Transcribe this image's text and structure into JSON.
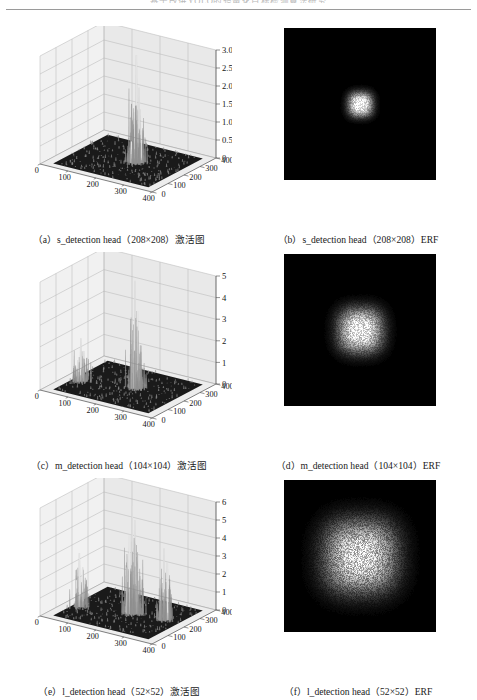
{
  "page": {
    "running_head": "基于改进YOLO的轻量化目标检测算法研究",
    "background_color": "#ffffff"
  },
  "figure": {
    "panels": [
      {
        "id": "a",
        "label": "（a）s_detection head（208×208）激活图",
        "type": "surface3d",
        "head": "s_detection head",
        "resolution": "208×208",
        "kind": "激活图"
      },
      {
        "id": "b",
        "label": "（b）s_detection head（208×208）ERF",
        "type": "erf",
        "head": "s_detection head",
        "resolution": "208×208",
        "kind": "ERF"
      },
      {
        "id": "c",
        "label": "（c）m_detection head（104×104）激活图",
        "type": "surface3d",
        "head": "m_detection head",
        "resolution": "104×104",
        "kind": "激活图"
      },
      {
        "id": "d",
        "label": "（d）m_detection head（104×104）ERF",
        "type": "erf",
        "head": "m_detection head",
        "resolution": "104×104",
        "kind": "ERF"
      },
      {
        "id": "e",
        "label": "（e）l_detection head（52×52）激活图",
        "type": "surface3d",
        "head": "l_detection head",
        "resolution": "52×52",
        "kind": "激活图"
      },
      {
        "id": "f",
        "label": "（f）l_detection head（52×52）ERF",
        "type": "erf",
        "head": "l_detection head",
        "resolution": "52×52",
        "kind": "ERF"
      }
    ]
  },
  "chart_data": [
    {
      "type": "surface",
      "panel": "a",
      "title": "s_detection head (208×208) activation map",
      "xlabel": "",
      "ylabel": "",
      "zlabel": "",
      "xticks": [
        0,
        100,
        200,
        300,
        400
      ],
      "yticks": [
        0,
        100,
        200,
        300,
        400
      ],
      "zticks": [
        "0",
        "0.5",
        "1.0",
        "1.5",
        "2.0",
        "2.5",
        "3.0"
      ],
      "xlim": [
        0,
        400
      ],
      "ylim": [
        0,
        400
      ],
      "zlim": [
        0,
        3.0
      ],
      "grid": true,
      "legend": "none",
      "colormap": "grayscale",
      "base_plane_color": "#1a1a1a",
      "peak_value": 3.0,
      "peak_x": 230,
      "peak_y": 200,
      "description": "Single dominant narrow central spike reaching 3.0 on an otherwise flat dark base plane; very low background noise.",
      "spikes": [
        {
          "x": 230,
          "y": 200,
          "height": 3.0
        },
        {
          "x": 236,
          "y": 206,
          "height": 2.1
        },
        {
          "x": 224,
          "y": 196,
          "height": 1.4
        },
        {
          "x": 242,
          "y": 210,
          "height": 0.9
        },
        {
          "x": 218,
          "y": 190,
          "height": 0.6
        }
      ]
    },
    {
      "type": "surface",
      "panel": "c",
      "title": "m_detection head (104×104) activation map",
      "xlabel": "",
      "ylabel": "",
      "zlabel": "",
      "xticks": [
        0,
        100,
        200,
        300,
        400
      ],
      "yticks": [
        0,
        100,
        200,
        300,
        400
      ],
      "zticks": [
        "0",
        "1",
        "2",
        "3",
        "4",
        "5"
      ],
      "xlim": [
        0,
        400
      ],
      "ylim": [
        0,
        400
      ],
      "zlim": [
        0,
        5
      ],
      "grid": true,
      "legend": "none",
      "colormap": "grayscale",
      "base_plane_color": "#1a1a1a",
      "peak_value": 5.0,
      "peak_x": 225,
      "peak_y": 200,
      "description": "Tall central spike cluster reaching 5 with a secondary cluster of medium spikes near the left edge around x=60.",
      "spikes": [
        {
          "x": 225,
          "y": 200,
          "height": 5.0
        },
        {
          "x": 231,
          "y": 205,
          "height": 3.6
        },
        {
          "x": 219,
          "y": 195,
          "height": 2.6
        },
        {
          "x": 237,
          "y": 212,
          "height": 1.7
        },
        {
          "x": 60,
          "y": 150,
          "height": 2.0
        },
        {
          "x": 66,
          "y": 158,
          "height": 1.4
        },
        {
          "x": 54,
          "y": 143,
          "height": 1.0
        }
      ]
    },
    {
      "type": "surface",
      "panel": "e",
      "title": "l_detection head (52×52) activation map",
      "xlabel": "",
      "ylabel": "",
      "zlabel": "",
      "xticks": [
        0,
        100,
        200,
        300,
        400
      ],
      "yticks": [
        0,
        100,
        200,
        300,
        400
      ],
      "zticks": [
        "0",
        "1",
        "2",
        "3",
        "4",
        "5",
        "6"
      ],
      "xlim": [
        0,
        400
      ],
      "ylim": [
        0,
        400
      ],
      "zlim": [
        0,
        6
      ],
      "grid": true,
      "legend": "none",
      "colormap": "grayscale",
      "base_plane_color": "#1a1a1a",
      "peak_value": 6.0,
      "peak_x": 215,
      "peak_y": 200,
      "description": "Broad multi-spike response: a tall central cluster reaching 6, a distinct right-hand cluster near x=320 reaching about 4, and a smaller left cluster near x=55 reaching about 3.",
      "spikes": [
        {
          "x": 215,
          "y": 200,
          "height": 6.0
        },
        {
          "x": 221,
          "y": 206,
          "height": 5.2
        },
        {
          "x": 209,
          "y": 194,
          "height": 4.4
        },
        {
          "x": 227,
          "y": 212,
          "height": 3.4
        },
        {
          "x": 203,
          "y": 188,
          "height": 2.6
        },
        {
          "x": 320,
          "y": 215,
          "height": 4.0
        },
        {
          "x": 328,
          "y": 222,
          "height": 3.2
        },
        {
          "x": 312,
          "y": 208,
          "height": 2.4
        },
        {
          "x": 55,
          "y": 150,
          "height": 3.0
        },
        {
          "x": 62,
          "y": 158,
          "height": 2.2
        },
        {
          "x": 48,
          "y": 143,
          "height": 1.5
        }
      ]
    },
    {
      "type": "heatmap",
      "panel": "b",
      "title": "s_detection head (208×208) ERF",
      "xlabel": "",
      "ylabel": "",
      "grid": false,
      "legend": "none",
      "colormap": "grayscale",
      "background_color": "#000000",
      "blob_color": "#ffffff",
      "center": [
        0.5,
        0.5
      ],
      "radius_fraction": 0.085,
      "intensity_peak": 1.0,
      "description": "Very small, tight, high-contrast circular effective receptive field at the image centre; remainder of the field is black."
    },
    {
      "type": "heatmap",
      "panel": "d",
      "title": "m_detection head (104×104) ERF",
      "xlabel": "",
      "ylabel": "",
      "grid": false,
      "legend": "none",
      "colormap": "grayscale",
      "background_color": "#000000",
      "blob_color": "#ffffff",
      "center": [
        0.5,
        0.5
      ],
      "radius_fraction": 0.155,
      "intensity_peak": 0.92,
      "description": "Medium-sized, moderately speckled square-ish effective receptive field at the centre, noticeably larger than panel (b)."
    },
    {
      "type": "heatmap",
      "panel": "f",
      "title": "l_detection head (52×52) ERF",
      "xlabel": "",
      "ylabel": "",
      "grid": false,
      "legend": "none",
      "colormap": "grayscale",
      "background_color": "#000000",
      "blob_color": "#ffffff",
      "center": [
        0.5,
        0.5
      ],
      "radius_fraction": 0.255,
      "intensity_peak": 0.82,
      "description": "Large, diffuse, heavily speckled rounded-square effective receptive field covering roughly half the field width; the largest of the three ERFs."
    }
  ]
}
